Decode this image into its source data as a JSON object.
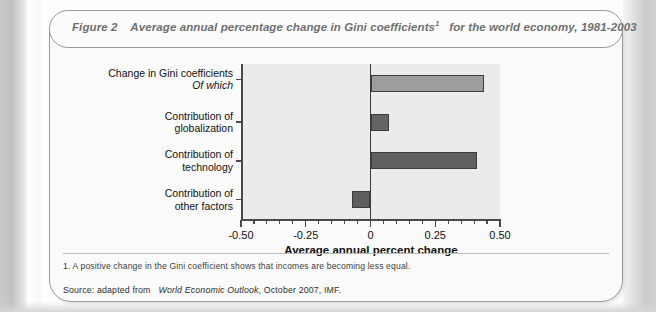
{
  "figure": {
    "title_prefix": "Figure 2",
    "title_text": "Average annual percentage change in Gini coefficients",
    "title_footnote_marker": "1",
    "title_suffix": "for the world economy, 1981-2003",
    "footnote": "1. A positive change in the Gini coefficient shows that incomes are becoming less equal.",
    "source_prefix": "Source: adapted from",
    "source_italic": "World Economic Outlook",
    "source_suffix": ", October 2007, IMF."
  },
  "chart_data": {
    "type": "bar",
    "orientation": "horizontal",
    "xlabel": "Average annual percent change",
    "ylabel": "",
    "categories": [
      "Change in Gini coefficients",
      "Contribution of globalization",
      "Contribution of technology",
      "Contribution of other factors"
    ],
    "category_lines": [
      [
        "Change in Gini coefficients",
        "Of which"
      ],
      [
        "Contribution of",
        "globalization"
      ],
      [
        "Contribution of",
        "technology"
      ],
      [
        "Contribution of",
        "other factors"
      ]
    ],
    "values": [
      0.44,
      0.07,
      0.41,
      -0.07
    ],
    "colors": [
      "#9d9d9d",
      "#646464",
      "#606060",
      "#5e5e5e"
    ],
    "xlim": [
      -0.5,
      0.5
    ],
    "xticks": [
      -0.5,
      -0.25,
      0,
      0.25,
      0.5
    ],
    "xticklabels": [
      "-0.50",
      "-0.25",
      "0",
      "0.25",
      "0.50"
    ],
    "minor_tick_step": 0.05,
    "grid": false,
    "legend": false,
    "plot_background": "#ebebeb"
  }
}
